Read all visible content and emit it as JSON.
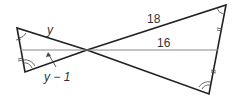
{
  "diagram": {
    "type": "geometry-similar-triangles",
    "labels": {
      "y": "y",
      "y_minus_1": "y − 1",
      "eighteen": "18",
      "sixteen": "16"
    },
    "colors": {
      "line": "#222222",
      "thin_line": "#777777",
      "text": "#333333"
    }
  }
}
